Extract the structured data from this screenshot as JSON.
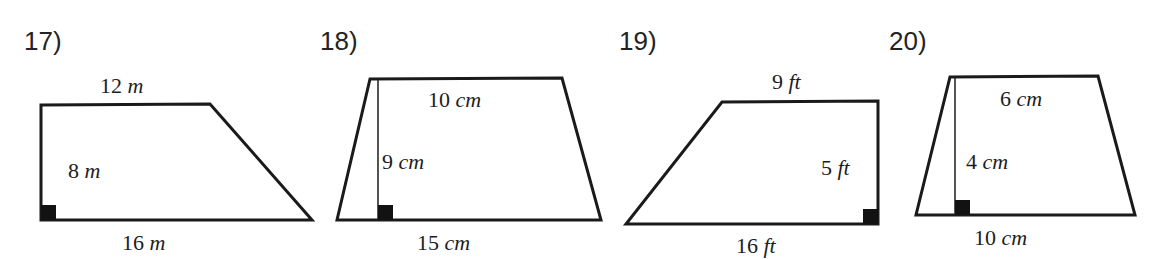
{
  "worksheet": {
    "background_color": "#ffffff",
    "ink_color": "#1a1a1a"
  },
  "problems": [
    {
      "number_label": "17)",
      "number_pos": {
        "x": 24,
        "y": 28
      },
      "shape": "right trapezoid",
      "points": "41,105 210,104 312,220 41,220",
      "right_angle_mark": {
        "x": 41,
        "y": 205,
        "w": 15,
        "h": 15
      },
      "height_line": null,
      "labels": [
        {
          "name": "top-side-length",
          "num": "12",
          "unit": "m",
          "x": 100,
          "y": 75
        },
        {
          "name": "height-length",
          "num": "8",
          "unit": "m",
          "x": 68,
          "y": 160
        },
        {
          "name": "bottom-side-length",
          "num": "16",
          "unit": "m",
          "x": 122,
          "y": 232
        }
      ]
    },
    {
      "number_label": "18)",
      "number_pos": {
        "x": 320,
        "y": 28
      },
      "shape": "isosceles trapezoid with interior height",
      "points": "370,79 562,78 601,220 337,220",
      "right_angle_mark": {
        "x": 378,
        "y": 205,
        "w": 15,
        "h": 15
      },
      "height_line": {
        "x1": 378,
        "y1": 80,
        "x2": 378,
        "y2": 220
      },
      "labels": [
        {
          "name": "top-side-length",
          "num": "10",
          "unit": "cm",
          "x": 428,
          "y": 89
        },
        {
          "name": "height-length",
          "num": "9",
          "unit": "cm",
          "x": 382,
          "y": 151
        },
        {
          "name": "bottom-side-length",
          "num": "15",
          "unit": "cm",
          "x": 417,
          "y": 232
        }
      ]
    },
    {
      "number_label": "19)",
      "number_pos": {
        "x": 619,
        "y": 28
      },
      "shape": "right trapezoid",
      "points": "722,102 878,101 878,224 626,224",
      "right_angle_mark": {
        "x": 863,
        "y": 209,
        "w": 15,
        "h": 15
      },
      "height_line": null,
      "labels": [
        {
          "name": "top-side-length",
          "num": "9",
          "unit": "ft",
          "x": 772,
          "y": 71
        },
        {
          "name": "height-length",
          "num": "5",
          "unit": "ft",
          "x": 821,
          "y": 157
        },
        {
          "name": "bottom-side-length",
          "num": "16",
          "unit": "ft",
          "x": 736,
          "y": 235
        }
      ]
    },
    {
      "number_label": "20)",
      "number_pos": {
        "x": 889,
        "y": 28
      },
      "shape": "trapezoid with interior height",
      "points": "950,77 1098,76 1135,215 916,215",
      "right_angle_mark": {
        "x": 955,
        "y": 200,
        "w": 15,
        "h": 15
      },
      "height_line": {
        "x1": 955,
        "y1": 78,
        "x2": 955,
        "y2": 215
      },
      "labels": [
        {
          "name": "top-side-length",
          "num": "6",
          "unit": "cm",
          "x": 1000,
          "y": 88
        },
        {
          "name": "height-length",
          "num": "4",
          "unit": "cm",
          "x": 966,
          "y": 151
        },
        {
          "name": "bottom-side-length",
          "num": "10",
          "unit": "cm",
          "x": 974,
          "y": 227
        }
      ]
    }
  ]
}
